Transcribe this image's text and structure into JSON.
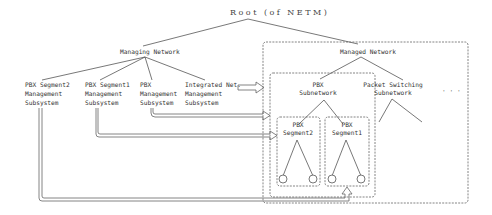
{
  "root": {
    "label": "Root (of NETM)"
  },
  "managing_network": {
    "label": "Managing Network",
    "children": [
      {
        "id": "pbx-seg2-mgmt",
        "lines": [
          "PBX Segment2",
          "Management",
          "Subsystem"
        ]
      },
      {
        "id": "pbx-seg1-mgmt",
        "lines": [
          "PBX Segment1",
          "Management",
          "Subsystem"
        ]
      },
      {
        "id": "pbx-mgmt",
        "lines": [
          "PBX",
          "Management",
          "Subsystem"
        ]
      },
      {
        "id": "integrated-mgmt",
        "lines": [
          "Integrated Net.",
          "Management",
          "Subsystem"
        ]
      }
    ]
  },
  "managed_network": {
    "label": "Managed Network",
    "children": [
      {
        "id": "pbx-subnetwork",
        "lines": [
          "PBX",
          "Subnetwork"
        ],
        "segments": [
          {
            "id": "pbx-segment2",
            "lines": [
              "PBX",
              "Segment2"
            ]
          },
          {
            "id": "pbx-segment1",
            "lines": [
              "PBX",
              "Segment1"
            ]
          }
        ]
      },
      {
        "id": "packet-switching-subnetwork",
        "lines": [
          "Packet Switching",
          "Subnetwork"
        ]
      }
    ],
    "ellipsis": "· · ·"
  }
}
